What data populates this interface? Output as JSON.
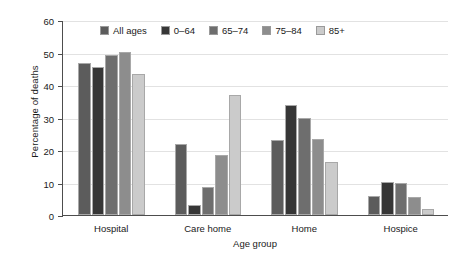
{
  "chart_data": {
    "type": "bar",
    "title": "",
    "xlabel": "Age group",
    "ylabel": "Percentage of deaths",
    "categories": [
      "Hospital",
      "Care home",
      "Home",
      "Hospice"
    ],
    "series": [
      {
        "name": "All ages",
        "color": "#5c5c5c",
        "values": [
          46.8,
          21.7,
          23.2,
          5.8
        ]
      },
      {
        "name": "0–64",
        "color": "#363636",
        "values": [
          45.5,
          3.0,
          34.0,
          10.3
        ]
      },
      {
        "name": "65–74",
        "color": "#6e6e6e",
        "values": [
          49.2,
          8.5,
          30.0,
          10.0
        ]
      },
      {
        "name": "75–84",
        "color": "#8d8d8d",
        "values": [
          50.3,
          18.5,
          23.5,
          5.5
        ]
      },
      {
        "name": "85+",
        "color": "#cbcbcb",
        "values": [
          43.5,
          36.8,
          16.2,
          1.8
        ]
      }
    ],
    "ylim": [
      0,
      60
    ],
    "yticks": [
      0,
      10,
      20,
      30,
      40,
      50,
      60
    ],
    "ytick_labels": [
      "0",
      "10",
      "20",
      "30",
      "40",
      "50",
      "60"
    ],
    "grid": true,
    "legend_position": "top-center"
  }
}
